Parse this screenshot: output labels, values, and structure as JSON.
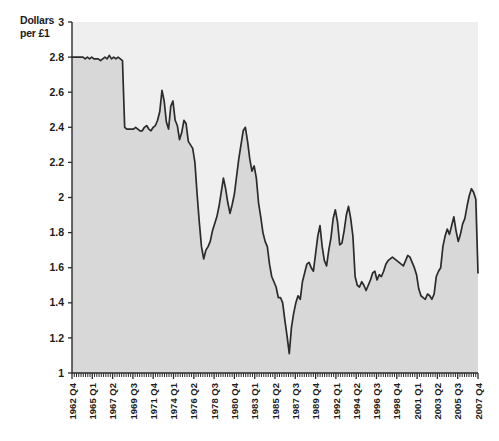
{
  "chart_data": {
    "type": "area",
    "title": "",
    "subtitle": "",
    "ylabel": "Dollars per £1",
    "xlabel": "",
    "ylim": [
      1,
      3
    ],
    "y_ticks": [
      "1",
      "1.2",
      "1.4",
      "1.6",
      "1.8",
      "2",
      "2.2",
      "2.4",
      "2.6",
      "2.8",
      "3"
    ],
    "y_tick_values": [
      1,
      1.2,
      1.4,
      1.6,
      1.8,
      2,
      2.2,
      2.4,
      2.6,
      2.8,
      3
    ],
    "grid": false,
    "legend": "none",
    "line_color": "#2b2b2b",
    "fill_color": "#d8d8d8",
    "plot_background": "#efefef",
    "x_tick_labels": [
      "1962 Q4",
      "1965 Q1",
      "1967 Q2",
      "1969 Q3",
      "1971 Q4",
      "1974 Q1",
      "1976 Q2",
      "1978 Q3",
      "1980 Q4",
      "1983 Q1",
      "1985 Q2",
      "1987 Q3",
      "1989 Q4",
      "1992 Q1",
      "1994 Q2",
      "1996 Q3",
      "1998 Q4",
      "2001 Q1",
      "2003 Q2",
      "2005 Q3",
      "2007 Q4"
    ],
    "x_label_interval": 9,
    "x_start": "1962 Q4",
    "x_end": "2008 Q1",
    "x_minor_tick_count": 182,
    "series": [
      {
        "name": "Dollars per £1",
        "values": [
          2.8,
          2.8,
          2.8,
          2.8,
          2.8,
          2.8,
          2.79,
          2.8,
          2.79,
          2.8,
          2.79,
          2.79,
          2.79,
          2.78,
          2.79,
          2.8,
          2.79,
          2.81,
          2.79,
          2.8,
          2.79,
          2.8,
          2.79,
          2.78,
          2.4,
          2.39,
          2.39,
          2.39,
          2.39,
          2.4,
          2.39,
          2.38,
          2.38,
          2.4,
          2.41,
          2.39,
          2.38,
          2.4,
          2.41,
          2.44,
          2.49,
          2.61,
          2.55,
          2.43,
          2.39,
          2.52,
          2.55,
          2.44,
          2.41,
          2.33,
          2.37,
          2.44,
          2.42,
          2.32,
          2.3,
          2.28,
          2.2,
          2.02,
          1.86,
          1.72,
          1.65,
          1.7,
          1.72,
          1.75,
          1.81,
          1.85,
          1.89,
          1.95,
          2.03,
          2.11,
          2.05,
          1.97,
          1.91,
          1.96,
          2.02,
          2.12,
          2.22,
          2.3,
          2.38,
          2.4,
          2.32,
          2.22,
          2.15,
          2.18,
          2.11,
          1.97,
          1.89,
          1.8,
          1.75,
          1.72,
          1.62,
          1.55,
          1.52,
          1.49,
          1.43,
          1.43,
          1.4,
          1.3,
          1.21,
          1.11,
          1.26,
          1.34,
          1.4,
          1.44,
          1.42,
          1.52,
          1.57,
          1.62,
          1.63,
          1.6,
          1.58,
          1.68,
          1.78,
          1.84,
          1.72,
          1.64,
          1.61,
          1.7,
          1.77,
          1.88,
          1.93,
          1.86,
          1.73,
          1.74,
          1.81,
          1.9,
          1.95,
          1.88,
          1.78,
          1.55,
          1.5,
          1.49,
          1.52,
          1.5,
          1.47,
          1.5,
          1.53,
          1.57,
          1.58,
          1.53,
          1.56,
          1.55,
          1.58,
          1.62,
          1.64,
          1.65,
          1.66,
          1.65,
          1.64,
          1.63,
          1.62,
          1.61,
          1.64,
          1.67,
          1.66,
          1.63,
          1.6,
          1.56,
          1.48,
          1.44,
          1.43,
          1.42,
          1.45,
          1.44,
          1.42,
          1.45,
          1.55,
          1.58,
          1.6,
          1.72,
          1.78,
          1.82,
          1.79,
          1.84,
          1.89,
          1.81,
          1.75,
          1.79,
          1.85,
          1.88,
          1.95,
          2.01,
          2.05,
          2.03,
          1.99,
          1.57
        ]
      }
    ],
    "annotations": [
      {
        "label": "peak",
        "value": 2.81
      },
      {
        "label": "trough",
        "value": 1.11
      },
      {
        "label": "final",
        "value": 1.57
      }
    ]
  },
  "geometry": {
    "plot_left": 72,
    "plot_right": 478,
    "plot_top": 22,
    "plot_bottom": 373
  }
}
